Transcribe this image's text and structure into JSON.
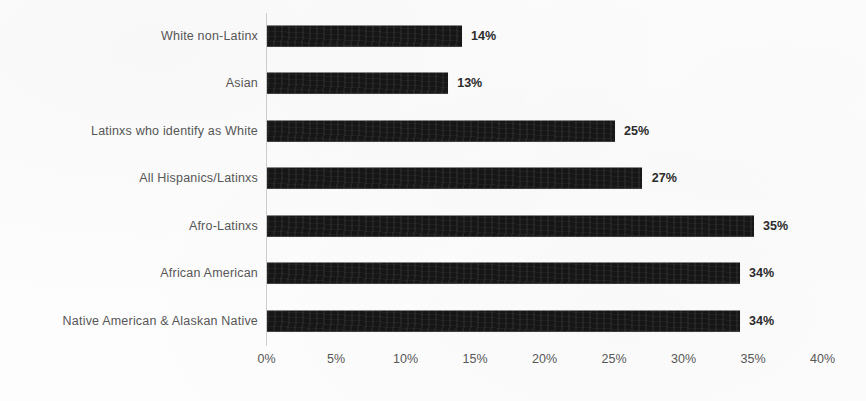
{
  "chart_data": {
    "type": "bar",
    "orientation": "horizontal",
    "title": "",
    "xlabel": "",
    "ylabel": "",
    "xlim": [
      0,
      40
    ],
    "grid": false,
    "legend": null,
    "categories": [
      "White non-Latinx",
      "Asian",
      "Latinxs who identify as White",
      "All Hispanics/Latinxs",
      "Afro-Latinxs",
      "African American",
      "Native American & Alaskan Native"
    ],
    "values": [
      14,
      13,
      25,
      27,
      35,
      34,
      34
    ],
    "value_labels": [
      "14%",
      "13%",
      "25%",
      "27%",
      "35%",
      "34%",
      "34%"
    ],
    "xticks": [
      0,
      5,
      10,
      15,
      20,
      25,
      30,
      35,
      40
    ],
    "xtick_labels": [
      "0%",
      "5%",
      "10%",
      "15%",
      "20%",
      "25%",
      "30%",
      "35%",
      "40%"
    ],
    "bar_color": "#161616",
    "label_color": "#575757",
    "axis_color": "#cfcfcf",
    "background_color": "#fdfdfd"
  },
  "caption": {
    "cut_off_text": ""
  }
}
